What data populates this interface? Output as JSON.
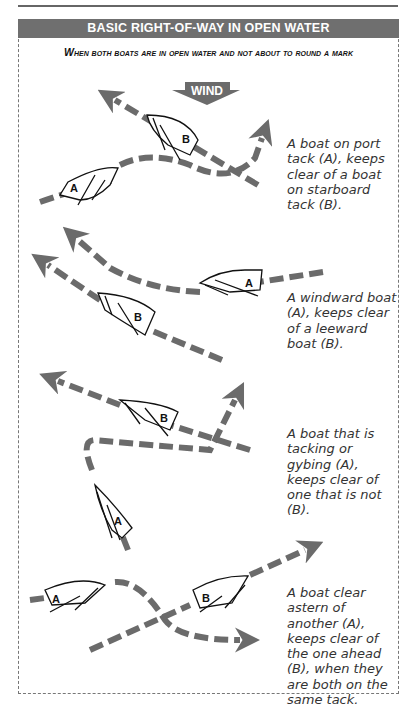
{
  "header": {
    "title": "BASIC RIGHT-OF-WAY IN OPEN WATER"
  },
  "subtitle": "When both boats are in open water and not about to round a mark",
  "wind_label": "WIND",
  "colors": {
    "header_bg": "#6f6f6f",
    "arrow": "#6b6b6b",
    "text": "#333333"
  },
  "scenarios": [
    {
      "id": "port-starboard",
      "boats": [
        "A",
        "B"
      ],
      "caption": "A boat on port tack (A), keeps clear of a boat on starboard tack (B)."
    },
    {
      "id": "windward-leeward",
      "boats": [
        "A",
        "B"
      ],
      "caption": "A windward boat (A), keeps clear of a leeward boat (B)."
    },
    {
      "id": "tacking-gybing",
      "boats": [
        "B",
        "A"
      ],
      "caption": "A boat that is tacking or gybing (A), keeps clear of one that is not (B)."
    },
    {
      "id": "clear-astern",
      "boats": [
        "A",
        "B"
      ],
      "caption": "A boat clear astern of another (A), keeps clear of the one ahead (B), when they are both on the same tack."
    }
  ]
}
